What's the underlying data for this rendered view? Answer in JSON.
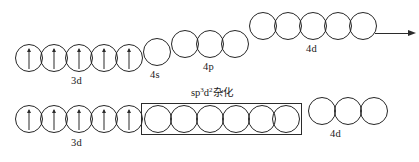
{
  "diagram": {
    "ink_color": "#262626",
    "background_color": "#ffffff"
  },
  "rows": [
    {
      "id": "ground-state",
      "name": "ground-state-configuration",
      "groups": [
        {
          "id": "top-3d",
          "label": "3d",
          "orbital_count": 5,
          "electrons": [
            "up",
            "up",
            "up",
            "up",
            "up"
          ],
          "boxed": false
        },
        {
          "id": "top-4s",
          "label": "4s",
          "orbital_count": 1,
          "electrons": [
            "empty"
          ],
          "boxed": false
        },
        {
          "id": "top-4p",
          "label": "4p",
          "orbital_count": 3,
          "electrons": [
            "empty",
            "empty",
            "empty"
          ],
          "boxed": false
        },
        {
          "id": "top-4d",
          "label": "4d",
          "orbital_count": 5,
          "electrons": [
            "empty",
            "empty",
            "empty",
            "empty",
            "empty"
          ],
          "boxed": false
        }
      ]
    },
    {
      "id": "hybridized-state",
      "name": "hybridized-configuration",
      "groups": [
        {
          "id": "bottom-3d",
          "label": "3d",
          "orbital_count": 5,
          "electrons": [
            "up",
            "up",
            "up",
            "up",
            "up"
          ],
          "boxed": false
        },
        {
          "id": "bottom-hybrid",
          "label": "sp3d2杂化",
          "label_base": "sp",
          "label_sup1": "3",
          "label_mid": "d",
          "label_sup2": "2",
          "label_tail": "杂化",
          "orbital_count": 6,
          "electrons": [
            "empty",
            "empty",
            "empty",
            "empty",
            "empty",
            "empty"
          ],
          "boxed": true
        },
        {
          "id": "bottom-4d",
          "label": "4d",
          "orbital_count": 3,
          "electrons": [
            "empty",
            "empty",
            "empty"
          ],
          "boxed": false
        }
      ]
    }
  ],
  "annotations": {
    "energy_arrow": {
      "name": "energy-increase-arrow",
      "direction": "right",
      "label": ""
    }
  }
}
